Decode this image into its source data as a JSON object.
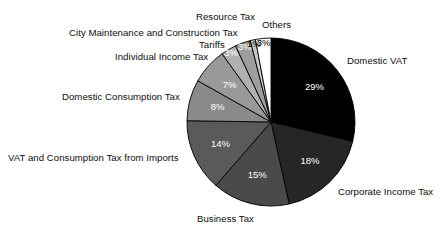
{
  "chart_data": {
    "type": "pie",
    "title": "",
    "xlabel": "",
    "ylabel": "",
    "legend_position": "callout-labels",
    "grid": false,
    "units": "percent",
    "categories": [
      "Domestic VAT",
      "Corporate Income Tax",
      "Business Tax",
      "VAT and Consumption Tax from Imports",
      "Domestic Consumption Tax",
      "Individual Income Tax",
      "Tariffs",
      "City Maintenance and Construction Tax",
      "Resource Tax",
      "Others"
    ],
    "values": [
      29,
      18,
      15,
      14,
      8,
      7,
      3,
      3,
      1,
      3
    ],
    "value_labels": [
      "29%",
      "18%",
      "15%",
      "14%",
      "8%",
      "7%",
      "3%",
      "3%",
      "1%",
      "3%"
    ],
    "colors": [
      "#000000",
      "#262626",
      "#4a4a4a",
      "#5a5a5a",
      "#8a8a8a",
      "#999999",
      "#b0b0b0",
      "#9e9e9e",
      "#c8c8c8",
      "#ffffff"
    ],
    "label_colors": [
      "#ffffff",
      "#ffffff",
      "#ffffff",
      "#ffffff",
      "#ffffff",
      "#ffffff",
      "#ffffff",
      "#ffffff",
      "#000000",
      "#000000"
    ],
    "start_angle_deg": 0,
    "direction": "clockwise"
  },
  "geometry": {
    "center_x": 271,
    "center_y": 122,
    "radius": 84
  },
  "callouts": [
    {
      "key": "domestic-vat",
      "text": "Domestic VAT",
      "x": 347,
      "y": 55,
      "align": "left"
    },
    {
      "key": "corporate-income",
      "text": "Corporate Income Tax",
      "x": 338,
      "y": 186,
      "align": "left"
    },
    {
      "key": "business-tax",
      "text": "Business Tax",
      "x": 197,
      "y": 213,
      "align": "left"
    },
    {
      "key": "vat-imports",
      "text": "VAT and Consumption Tax from Imports",
      "x": 8,
      "y": 152,
      "align": "left"
    },
    {
      "key": "domestic-consumption",
      "text": "Domestic Consumption Tax",
      "x": 62,
      "y": 91,
      "align": "left"
    },
    {
      "key": "individual-income",
      "text": "Individual Income Tax",
      "x": 115,
      "y": 51,
      "align": "left"
    },
    {
      "key": "tariffs",
      "text": "Tariffs",
      "x": 199,
      "y": 39,
      "align": "left"
    },
    {
      "key": "city-maintenance",
      "text": "City Maintenance and Construction Tax",
      "x": 69,
      "y": 27,
      "align": "left"
    },
    {
      "key": "resource-tax",
      "text": "Resource Tax",
      "x": 196,
      "y": 11,
      "align": "left"
    },
    {
      "key": "others",
      "text": "Others",
      "x": 262,
      "y": 19,
      "align": "left"
    }
  ]
}
